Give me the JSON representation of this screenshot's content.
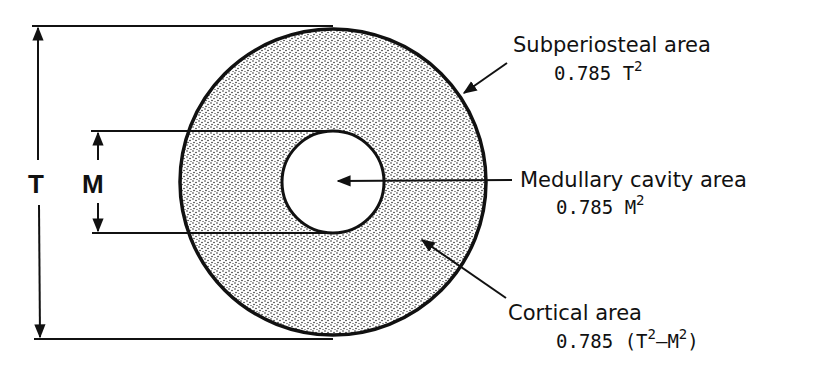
{
  "diagram": {
    "type": "cross-section",
    "colors": {
      "ink": "#111111",
      "stipple": "#1a1a1a",
      "background": "#ffffff"
    },
    "dimensions": {
      "outer_label": "T",
      "inner_label": "M"
    },
    "labels": {
      "subperiosteal": {
        "title": "Subperiosteal area",
        "coef": "0.785 T",
        "sup": "2"
      },
      "medullary": {
        "title": "Medullary cavity area",
        "coef": "0.785 M",
        "sup": "2"
      },
      "cortical": {
        "title": "Cortical area",
        "prefix": "0.785 (T",
        "sup1": "2",
        "mid": "–M",
        "sup2": "2",
        "suffix": ")"
      }
    }
  }
}
